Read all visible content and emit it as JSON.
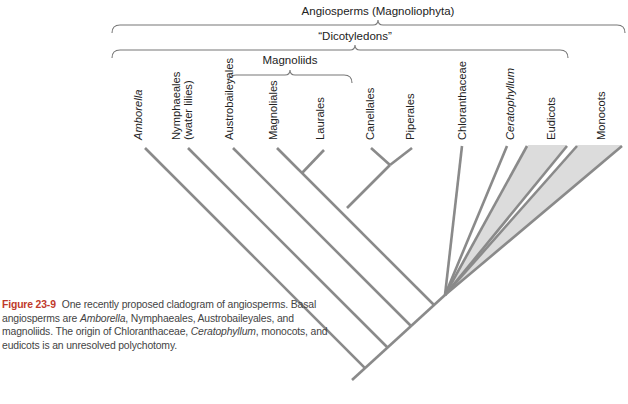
{
  "figure": {
    "groups": {
      "angiosperms": "Angiosperms (Magnoliophyta)",
      "dicotyledons": "“Dicotyledons”",
      "magnoliids": "Magnoliids"
    },
    "taxa": [
      {
        "name": "Amborella",
        "italic": true
      },
      {
        "name": "Nymphaeales",
        "line2": "(water lilies)",
        "italic": false
      },
      {
        "name": "Austrobaileyales",
        "italic": false
      },
      {
        "name": "Magnoliales",
        "italic": false
      },
      {
        "name": "Laurales",
        "italic": false
      },
      {
        "name": "Canellales",
        "italic": false
      },
      {
        "name": "Piperales",
        "italic": false
      },
      {
        "name": "Chloranthaceae",
        "italic": false
      },
      {
        "name": "Ceratophyllum",
        "italic": true
      },
      {
        "name": "Eudicots",
        "italic": false
      },
      {
        "name": "Monocots",
        "italic": false
      }
    ],
    "colors": {
      "branch": "#8a8a8a",
      "clade_fill": "#dcdcdc",
      "brace": "#777777",
      "figure_label": "#c0392b"
    }
  },
  "caption": {
    "label": "Figure 23-9",
    "seg1": "One recently proposed cladogram of angiosperms. Basal angiosperms are ",
    "it1": "Amborella",
    "seg2": ", Nymphaeales, Austrobaileyales, and magnoliids. The origin of Chloranthaceae, ",
    "it2": "Ceratophyllum",
    "seg3": ", monocots, and eudicots is an unresolved polychotomy."
  }
}
